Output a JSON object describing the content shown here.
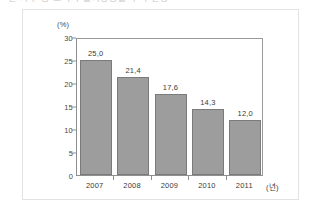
{
  "caption": {
    "text": "일 가구 중 소비자 물가상승률 추이 현황"
  },
  "chart_data": {
    "type": "bar",
    "title": "",
    "subtitle": "",
    "xlabel": "(년)",
    "ylabel": "(%)",
    "categories": [
      "2007",
      "2008",
      "2009",
      "2010",
      "2011"
    ],
    "values": [
      25.0,
      21.4,
      17.6,
      14.3,
      12.0
    ],
    "value_labels": [
      "25,0",
      "21,4",
      "17,6",
      "14,3",
      "12,0"
    ],
    "ylim": [
      0,
      30
    ],
    "yticks": [
      0,
      5,
      10,
      15,
      20,
      25,
      30
    ],
    "ytick_labels": [
      "0",
      "5",
      "10",
      "15",
      "20",
      "25",
      "30"
    ],
    "grid": false,
    "legend": false,
    "legend_position": "none",
    "bar_color": "#9d9d9d",
    "bar_edge_color": "#7b7b7b",
    "axis_color": "#8f8f8f",
    "text_color": "#3b3b3b",
    "frame_color": "#e2e2e2",
    "background": "#ffffff"
  }
}
